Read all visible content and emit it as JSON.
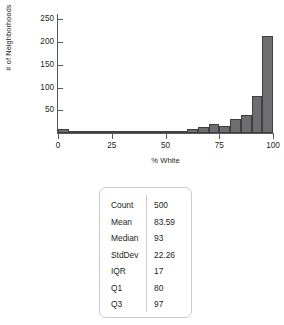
{
  "chart_data": {
    "type": "bar",
    "title": "",
    "xlabel": "% White",
    "ylabel": "# of Neighborhoods",
    "xlim": [
      0,
      100
    ],
    "ylim": [
      0,
      262
    ],
    "grid": false,
    "legend": null,
    "bin_width": 5,
    "x_ticks": [
      {
        "value": 0,
        "label": "0"
      },
      {
        "value": 25,
        "label": "25"
      },
      {
        "value": 50,
        "label": "50"
      },
      {
        "value": 75,
        "label": "75"
      },
      {
        "value": 100,
        "label": "100"
      }
    ],
    "y_ticks": [
      {
        "value": 50,
        "label": "50"
      },
      {
        "value": 100,
        "label": "100"
      },
      {
        "value": 150,
        "label": "150"
      },
      {
        "value": 200,
        "label": "200"
      },
      {
        "value": 250,
        "label": "250"
      }
    ],
    "bar_color": "#6e6e70",
    "bar_edge_color": "#3f3f41",
    "axis_color": "#58595b",
    "categories": [
      "0-5",
      "5-10",
      "10-15",
      "15-20",
      "20-25",
      "25-30",
      "30-35",
      "35-40",
      "40-45",
      "45-50",
      "50-55",
      "55-60",
      "60-65",
      "65-70",
      "70-75",
      "75-80",
      "80-85",
      "85-90",
      "90-95",
      "95-100"
    ],
    "bins": [
      {
        "start": 0,
        "end": 5,
        "count": 9
      },
      {
        "start": 5,
        "end": 10,
        "count": 3
      },
      {
        "start": 10,
        "end": 15,
        "count": 5
      },
      {
        "start": 15,
        "end": 20,
        "count": 1
      },
      {
        "start": 20,
        "end": 25,
        "count": 3
      },
      {
        "start": 25,
        "end": 30,
        "count": 3
      },
      {
        "start": 30,
        "end": 35,
        "count": 2
      },
      {
        "start": 35,
        "end": 40,
        "count": 2
      },
      {
        "start": 40,
        "end": 45,
        "count": 3
      },
      {
        "start": 45,
        "end": 50,
        "count": 3
      },
      {
        "start": 50,
        "end": 55,
        "count": 5
      },
      {
        "start": 55,
        "end": 60,
        "count": 4
      },
      {
        "start": 60,
        "end": 65,
        "count": 9
      },
      {
        "start": 65,
        "end": 70,
        "count": 14
      },
      {
        "start": 70,
        "end": 75,
        "count": 20
      },
      {
        "start": 75,
        "end": 80,
        "count": 16
      },
      {
        "start": 80,
        "end": 85,
        "count": 30
      },
      {
        "start": 85,
        "end": 90,
        "count": 39
      },
      {
        "start": 90,
        "end": 95,
        "count": 82
      },
      {
        "start": 95,
        "end": 100,
        "count": 213
      }
    ],
    "values": [
      9,
      3,
      5,
      1,
      3,
      3,
      2,
      2,
      3,
      3,
      5,
      4,
      9,
      14,
      20,
      16,
      30,
      39,
      82,
      213
    ]
  },
  "stats_table": {
    "rows": [
      {
        "label": "Count",
        "value": "500"
      },
      {
        "label": "Mean",
        "value": "83.59"
      },
      {
        "label": "Median",
        "value": "93"
      },
      {
        "label": "StdDev",
        "value": "22.26"
      },
      {
        "label": "IQR",
        "value": "17"
      },
      {
        "label": "Q1",
        "value": "80"
      },
      {
        "label": "Q3",
        "value": "97"
      }
    ]
  }
}
